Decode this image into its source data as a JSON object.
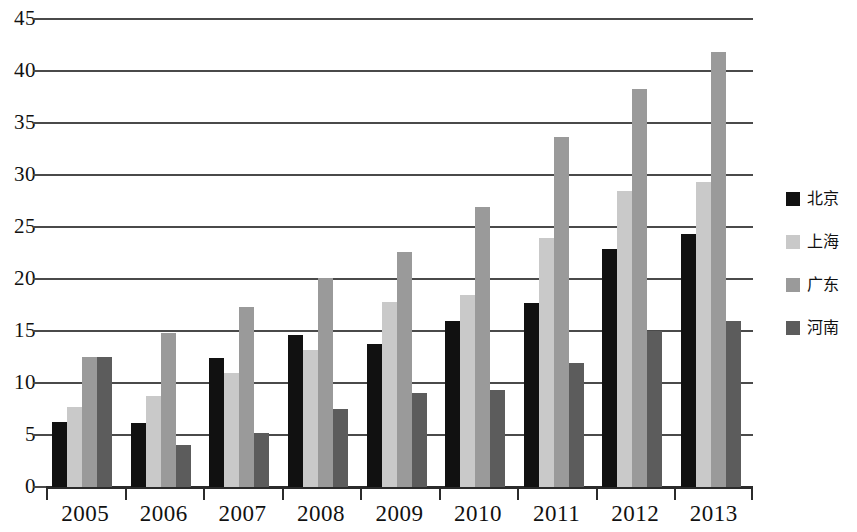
{
  "chart_data": {
    "type": "bar",
    "title": "",
    "xlabel": "",
    "ylabel": "",
    "grid": true,
    "legend_position": "right",
    "categories": [
      "2005",
      "2006",
      "2007",
      "2008",
      "2009",
      "2010",
      "2011",
      "2012",
      "2013"
    ],
    "ylim": [
      0,
      45
    ],
    "yticks": [
      "0",
      "5",
      "10",
      "15",
      "20",
      "25",
      "30",
      "35",
      "40",
      "45"
    ],
    "ytick_values": [
      0,
      5,
      10,
      15,
      20,
      25,
      30,
      35,
      40,
      45
    ],
    "series": [
      {
        "name": "北京",
        "color": "#111111",
        "values": [
          6.4,
          6.3,
          12.6,
          14.8,
          13.9,
          16.2,
          17.9,
          23.1,
          24.5
        ]
      },
      {
        "name": "上海",
        "color": "#c9c9c9",
        "values": [
          7.9,
          8.9,
          11.2,
          13.4,
          18.0,
          18.7,
          24.1,
          28.7,
          29.5
        ]
      },
      {
        "name": "广东",
        "color": "#9a9a9a",
        "values": [
          12.7,
          15.0,
          17.5,
          20.3,
          22.8,
          27.1,
          33.8,
          38.5,
          42.0
        ]
      },
      {
        "name": "河南",
        "color": "#5c5c5c",
        "values": [
          12.7,
          4.2,
          5.4,
          7.7,
          9.2,
          9.5,
          12.1,
          15.2,
          16.2
        ]
      }
    ]
  },
  "legend": {
    "items": [
      {
        "label": "北京",
        "swatch": "series-0-swatch"
      },
      {
        "label": "上海",
        "swatch": "series-1-swatch"
      },
      {
        "label": "广东",
        "swatch": "series-2-swatch"
      },
      {
        "label": "河南",
        "swatch": "series-3-swatch"
      }
    ]
  }
}
